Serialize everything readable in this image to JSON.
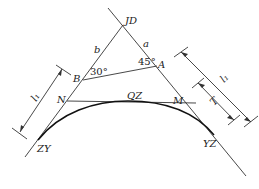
{
  "diagram": {
    "type": "road curve geometry (circular curve with tangents)",
    "points": {
      "JD": "JD",
      "A": "A",
      "B": "B",
      "N": "N",
      "M": "M",
      "QZ": "QZ",
      "ZY": "ZY",
      "YZ": "YZ"
    },
    "segments": {
      "a": "a",
      "b": "b"
    },
    "angles": {
      "at_B": "30°",
      "at_A": "45°"
    },
    "dimensions": {
      "left_l1": "l₁",
      "right_l1": "l₁",
      "right_T": "T"
    },
    "colors": {
      "line": "#333333",
      "curve": "#111111",
      "background": "#ffffff"
    }
  }
}
